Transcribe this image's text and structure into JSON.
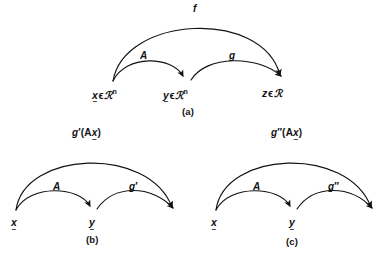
{
  "figure": {
    "background_color": "#ffffff",
    "ink_color": "#111111",
    "panels": [
      {
        "id": "a",
        "caption": "(a)",
        "top_arc_label": "f",
        "left_arc_label": "A",
        "right_arc_label": "g",
        "nodes": [
          {
            "id": "x",
            "variable": "x",
            "underset": "~",
            "membership": "ϵ",
            "set": "ℛ",
            "exponent": "n",
            "full_text": "x ϵ ℛⁿ"
          },
          {
            "id": "y",
            "variable": "y",
            "underset": "~",
            "membership": "ϵ",
            "set": "ℛ",
            "exponent": "n",
            "full_text": "y ϵ ℛⁿ"
          },
          {
            "id": "z",
            "variable": "z",
            "underset": "",
            "membership": "ϵ",
            "set": "ℛ",
            "exponent": "",
            "full_text": "z ϵ ℛ"
          }
        ]
      },
      {
        "id": "b",
        "caption": "(b)",
        "top_arc_label_prefix": "g",
        "top_arc_label_prime": "′",
        "top_arc_label_open": "(A",
        "top_arc_label_var": "x",
        "top_arc_label_underset": "~",
        "top_arc_label_close": ")",
        "top_arc_label_full": "g′(Ax)",
        "left_arc_label": "A",
        "right_arc_label_prefix": "g",
        "right_arc_label_prime": "′",
        "right_arc_label_full": "g′",
        "nodes": [
          {
            "id": "x",
            "variable": "x",
            "underset": "~"
          },
          {
            "id": "y",
            "variable": "y",
            "underset": "~"
          }
        ]
      },
      {
        "id": "c",
        "caption": "(c)",
        "top_arc_label_prefix": "g",
        "top_arc_label_prime": "″",
        "top_arc_label_open": "(A",
        "top_arc_label_var": "x",
        "top_arc_label_underset": "~",
        "top_arc_label_close": ")",
        "top_arc_label_full": "g″(Ax)",
        "left_arc_label": "A",
        "right_arc_label_prefix": "g",
        "right_arc_label_prime": "″",
        "right_arc_label_full": "g″",
        "nodes": [
          {
            "id": "x",
            "variable": "x",
            "underset": "~"
          },
          {
            "id": "y",
            "variable": "y",
            "underset": "~"
          }
        ]
      }
    ]
  }
}
